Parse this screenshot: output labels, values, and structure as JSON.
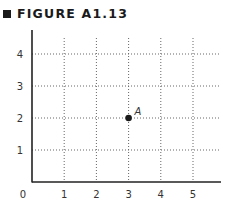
{
  "figure": {
    "title": "FIGURE A1.13"
  },
  "chart_data": {
    "type": "scatter",
    "title": "FIGURE A1.13",
    "xlabel": "",
    "ylabel": "",
    "x_ticks": [
      "1",
      "2",
      "3",
      "4",
      "5"
    ],
    "y_ticks": [
      "1",
      "2",
      "3",
      "4"
    ],
    "origin_label": "0",
    "xlim": [
      0,
      5.8
    ],
    "ylim": [
      0,
      4.7
    ],
    "grid": true,
    "grid_style": "dotted",
    "legend": null,
    "points": [
      {
        "label": "A",
        "x": 3,
        "y": 2
      }
    ]
  }
}
